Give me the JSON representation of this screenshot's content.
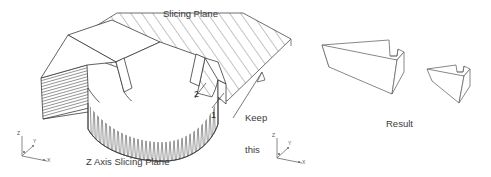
{
  "figure": {
    "type": "technical-diagram",
    "background_color": "#ffffff",
    "line_color": "#3a3a3a",
    "text_color": "#3a3a3a"
  },
  "labels": {
    "slicing_plane": "Slicing Plane",
    "z_axis_slicing_plane": "Z Axis Slicing Plane",
    "keep_this_side": "Keep\nthis\nside",
    "keep_this_side_lines": [
      "Keep",
      "this",
      "side"
    ],
    "result": "Result",
    "callout_1": "1",
    "callout_2": "2"
  },
  "axis_triads": [
    {
      "name": "left-axis-triad",
      "z": "Z",
      "y": "Y",
      "x": "X",
      "origin_mark": "o"
    },
    {
      "name": "center-axis-triad",
      "z": "Z",
      "y": "Y",
      "x": "X",
      "origin_mark": "o"
    }
  ],
  "annotations": {
    "keep_side_arrow": "arrow pointing up-right toward the retained material",
    "hatched_region": "diagonal cross-hatch indicates the cutting / slicing plane",
    "vertical_hatch": "dense zigzag stair-stepping on the curved outer wall",
    "horizontal_hatch": "horizontal layer lines on the left flat face"
  },
  "result_shapes": [
    {
      "name": "result-block-large",
      "description": "large wedge block with a notch on the top right"
    },
    {
      "name": "result-block-small",
      "description": "small wedge block with a notch on the top right"
    }
  ]
}
